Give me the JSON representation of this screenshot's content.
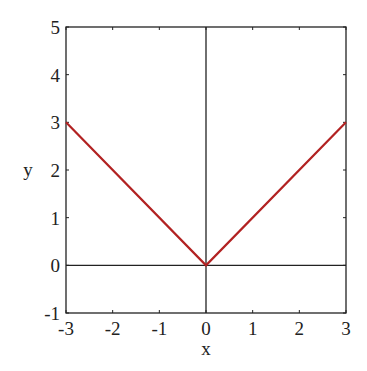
{
  "chart_data": {
    "type": "line",
    "title": "",
    "xlabel": "x",
    "ylabel": "y",
    "xlim": [
      -3,
      3
    ],
    "ylim": [
      -1,
      5
    ],
    "x_ticks": [
      "-3",
      "-2",
      "-1",
      "0",
      "1",
      "2",
      "3"
    ],
    "y_ticks": [
      "-1",
      "0",
      "1",
      "2",
      "3",
      "4",
      "5"
    ],
    "grid": false,
    "axes_lines_through_origin": true,
    "series": [
      {
        "name": "y = |x|",
        "color": "#b22222",
        "x": [
          -3,
          0,
          3
        ],
        "y": [
          3,
          0,
          3
        ]
      }
    ]
  },
  "colors": {
    "line": "#b22222",
    "axes": "#222222"
  }
}
